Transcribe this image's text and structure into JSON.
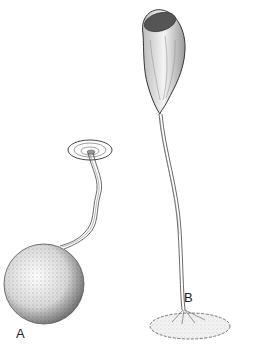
{
  "figure": {
    "labels": {
      "a": "A",
      "b": "B"
    },
    "colors": {
      "ink": "#222222",
      "background": "#ffffff"
    }
  }
}
